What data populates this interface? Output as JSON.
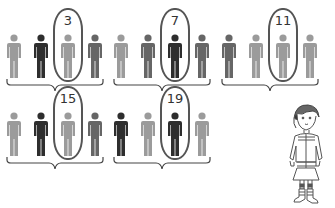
{
  "diagram": {
    "title": "",
    "colors": {
      "light": "#9b9b9b",
      "medium": "#666666",
      "dark": "#2e2e2e",
      "outline": "#555555"
    },
    "groups": [
      {
        "label": "3",
        "people": [
          "light",
          "dark",
          "light",
          "medium"
        ],
        "circled_index": 2
      },
      {
        "label": "7",
        "people": [
          "light",
          "medium",
          "dark",
          "medium"
        ],
        "circled_index": 2
      },
      {
        "label": "11",
        "people": [
          "medium",
          "light",
          "light",
          "light"
        ],
        "circled_index": 2
      },
      {
        "label": "15",
        "people": [
          "light",
          "dark",
          "light",
          "medium"
        ],
        "circled_index": 2
      },
      {
        "label": "19",
        "people": [
          "dark",
          "light",
          "dark",
          "light"
        ],
        "circled_index": 2
      }
    ],
    "character": {
      "description": "girl-standing"
    }
  }
}
